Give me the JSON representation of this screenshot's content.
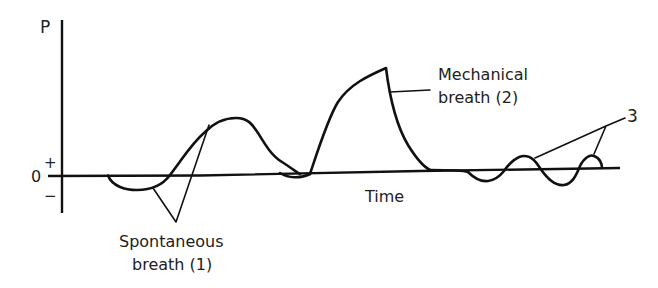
{
  "diagram": {
    "title": "",
    "axes": {
      "y_label": "P",
      "x_label": "Time",
      "zero_label": "0",
      "plus_label": "+",
      "minus_label": "−"
    },
    "annotations": {
      "spontaneous_line1": "Spontaneous",
      "spontaneous_line2": "breath (1)",
      "mechanical_line1": "Mechanical",
      "mechanical_line2": "breath (2)",
      "label_3": "3"
    },
    "segments": [
      {
        "id": "spontaneous-breath",
        "description": "small negative dip followed by positive hump"
      },
      {
        "id": "mechanical-breath",
        "description": "large positive pressure wave"
      },
      {
        "id": "oscillations-3",
        "description": "small oscillations around baseline"
      }
    ]
  }
}
